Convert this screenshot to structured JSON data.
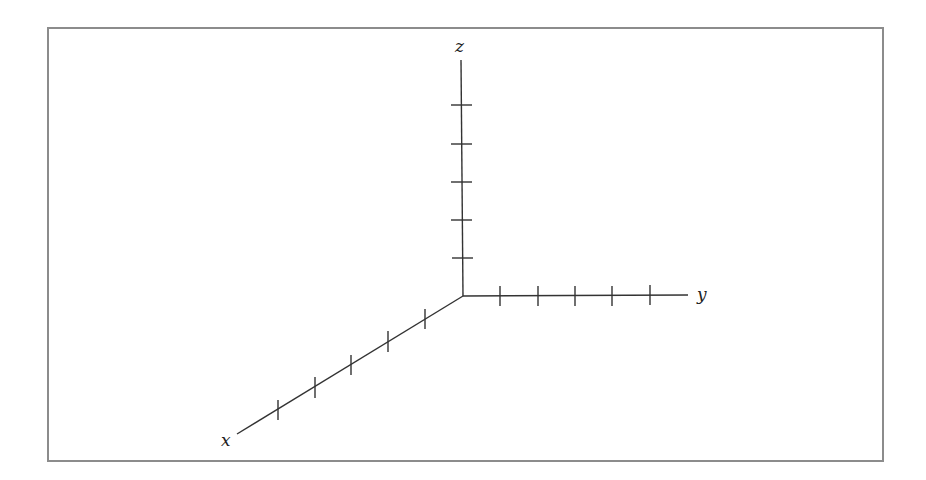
{
  "diagram": {
    "type": "3d-coordinate-axes",
    "colors": {
      "frame_border": "#8c8c8c",
      "axis_line": "#333333",
      "label": "#222222",
      "background": "#ffffff"
    },
    "origin": [
      463,
      296
    ],
    "axes": [
      {
        "name": "x",
        "label": "x",
        "end": [
          237,
          434
        ],
        "tick_count": 5,
        "ticks": [
          [
            425,
            319
          ],
          [
            388,
            342
          ],
          [
            351,
            365
          ],
          [
            315,
            388
          ],
          [
            278,
            410
          ]
        ]
      },
      {
        "name": "y",
        "label": "y",
        "end": [
          688,
          295
        ],
        "tick_count": 5,
        "ticks": [
          [
            500,
            296
          ],
          [
            538,
            296
          ],
          [
            575,
            296
          ],
          [
            612,
            296
          ],
          [
            650,
            296
          ]
        ]
      },
      {
        "name": "z",
        "label": "z",
        "end": [
          461,
          60
        ],
        "tick_count": 5,
        "ticks": [
          [
            462,
            258
          ],
          [
            462,
            220
          ],
          [
            461,
            182
          ],
          [
            461,
            144
          ],
          [
            461,
            105
          ]
        ]
      }
    ]
  }
}
